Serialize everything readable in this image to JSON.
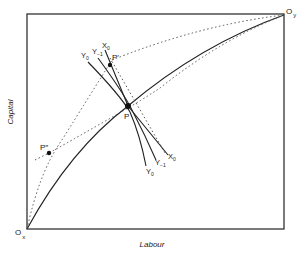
{
  "diagram": {
    "type": "edgeworth-box",
    "axes": {
      "x_label": "Labour",
      "y_label": "Capital"
    },
    "origins": {
      "x_origin": {
        "main": "O",
        "sub": "x"
      },
      "y_origin": {
        "main": "O",
        "sub": "y"
      }
    },
    "points": {
      "p": "P",
      "p_prime": "P′",
      "p_double_prime": "P″"
    },
    "isoquants": {
      "y0_upper": {
        "main": "Y",
        "sub": "0"
      },
      "y_minus1_upper": {
        "main": "Y",
        "sub": "−1"
      },
      "x0_upper": {
        "main": "X",
        "sub": "0"
      },
      "y0_lower": {
        "main": "Y",
        "sub": "0"
      },
      "y_minus1_lower": {
        "main": "Y",
        "sub": "−1"
      },
      "x0_lower": {
        "main": "X",
        "sub": "0"
      }
    },
    "colors": {
      "line": "#222222",
      "dotted": "#555555",
      "box": "#333333"
    }
  }
}
